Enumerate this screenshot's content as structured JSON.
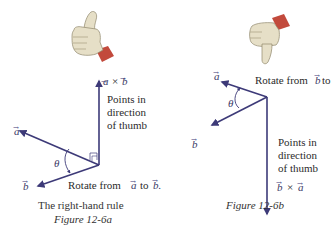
{
  "colors": {
    "vector": "#3d3a78",
    "text": "#2b2b2b",
    "skin": "#e6dfc7",
    "skin_shadow": "#b8ae8f",
    "cuff": "#c24a3c"
  },
  "figure_a": {
    "axb_label_a": "a",
    "axb_label_times": "×",
    "axb_label_b": "b",
    "points_line1": "Points in",
    "points_line2": "direction",
    "points_line3": "of thumb",
    "vec_a_label": "a",
    "vec_b_label": "b",
    "theta": "θ",
    "rotate_prefix": "Rotate from",
    "rotate_a": "a",
    "rotate_to": "to",
    "rotate_b": "b.",
    "caption_title": "The right-hand rule",
    "caption_figure": "Figure 12-6a",
    "thumb": "thumbs-up-hand-icon"
  },
  "figure_b": {
    "vec_a_label": "a",
    "vec_b_label": "b",
    "theta": "θ",
    "rotate_prefix": "Rotate from",
    "rotate_b": "b",
    "rotate_to": "to",
    "rotate_a": "a.",
    "points_line1": "Points in",
    "points_line2": "direction",
    "points_line3": "of thumb",
    "bxa_label_b": "b",
    "bxa_label_times": "×",
    "bxa_label_a": "a",
    "caption_figure": "Figure 12-6b",
    "thumb": "thumbs-down-hand-icon"
  }
}
